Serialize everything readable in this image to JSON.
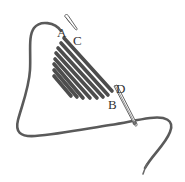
{
  "diagram": {
    "type": "embroidery-stitch-illustration",
    "labels": {
      "a": "A",
      "b": "B",
      "c": "C",
      "d": "D"
    },
    "colors": {
      "thread": "#5a5a5a",
      "stitch": "#4d4d4d",
      "background": "#ffffff",
      "label": "#333333"
    },
    "stitch_count": 8
  }
}
